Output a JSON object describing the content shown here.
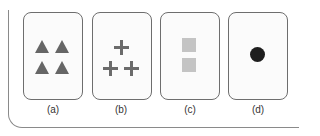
{
  "figure": {
    "panels": [
      {
        "label": "(a)",
        "shape": "triangle",
        "count": 4,
        "color": "#666666",
        "arrangement": "2x2 grid"
      },
      {
        "label": "(b)",
        "shape": "plus",
        "count": 3,
        "color": "#6b6b6b",
        "arrangement": "1 top, 2 bottom"
      },
      {
        "label": "(c)",
        "shape": "square",
        "count": 2,
        "color": "#c4c4c4",
        "arrangement": "vertical stack"
      },
      {
        "label": "(d)",
        "shape": "circle",
        "count": 1,
        "color": "#1e1e1e",
        "arrangement": "single centered"
      }
    ],
    "frame_color": "#8a8a8a",
    "card_border_color": "#6e6e6e"
  }
}
